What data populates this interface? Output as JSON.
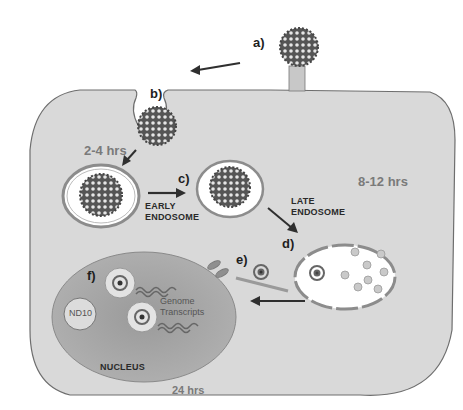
{
  "figure": {
    "colors": {
      "cytoplasm": "#d9d9d9",
      "cell_outline": "#6e6e6e",
      "nucleus": "#a8a8a8",
      "endosome_fill": "#ffffff",
      "endosome_ring": "#8c8c8c",
      "arrow": "#2f2f2f",
      "time_text": "#7a7a7a"
    },
    "steps": {
      "a": "a)",
      "b": "b)",
      "c": "c)",
      "d": "d)",
      "e": "e)",
      "f": "f)"
    },
    "times": {
      "t1": "2-4 hrs",
      "t2": "8-12 hrs",
      "t3": "24 hrs"
    },
    "labels": {
      "early_endosome_1": "EARLY",
      "early_endosome_2": "ENDOSOME",
      "late_endosome_1": "LATE",
      "late_endosome_2": "ENDOSOME",
      "nucleus": "NUCLEUS",
      "nd10": "ND10",
      "genome_1": "Genome",
      "genome_2": "Transcripts"
    }
  }
}
